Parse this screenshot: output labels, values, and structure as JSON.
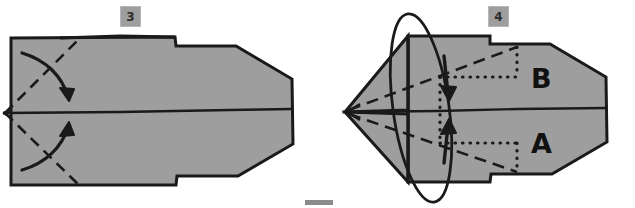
{
  "figure": {
    "paper_fill": "#9e9e9e",
    "ink_color": "#1a1a1a",
    "badge_fill": "#9e9e9e",
    "badge_border": "#b7b7b7",
    "background": "#ffffff",
    "footer_bar_color": "#8c8c8c"
  },
  "panels": [
    {
      "id": "step-3",
      "badge_label": "3",
      "shape_name": "folded-paper-arrowhead",
      "annotations": {
        "fold_lines": "dashed",
        "arrows": [
          {
            "name": "upper-fold-arrow",
            "direction": "down-right"
          },
          {
            "name": "lower-fold-arrow",
            "direction": "up-right"
          }
        ]
      },
      "point_labels": []
    },
    {
      "id": "step-4",
      "badge_label": "4",
      "shape_name": "folded-paper-dart",
      "annotations": {
        "fold_lines": "dashed",
        "measure_lines": "dotted",
        "rotation_loop": "ellipse",
        "arrows": [
          {
            "name": "flap-b-arrow",
            "direction": "down"
          },
          {
            "name": "flap-a-arrow",
            "direction": "up"
          }
        ]
      },
      "point_labels": [
        {
          "name": "label-b",
          "text": "B"
        },
        {
          "name": "label-a",
          "text": "A"
        }
      ]
    }
  ]
}
